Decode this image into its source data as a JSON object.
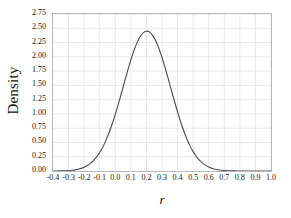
{
  "chart_data": {
    "type": "line",
    "title": "",
    "subtitle": "",
    "xlabel": "r",
    "ylabel": "Density",
    "xlim": [
      -0.4,
      1.0
    ],
    "ylim": [
      0.0,
      2.75
    ],
    "grid": true,
    "legend": null,
    "legend_position": "none",
    "annotations": [],
    "xticks": [
      "-0.4",
      "-0.3",
      "-0.2",
      "-0.1",
      "0.0",
      "0.1",
      "0.2",
      "0.3",
      "0.4",
      "0.5",
      "0.6",
      "0.7",
      "0.8",
      "0.9",
      "1.0"
    ],
    "xtick_values": [
      -0.4,
      -0.3,
      -0.2,
      -0.1,
      0.0,
      0.1,
      0.2,
      0.3,
      0.4,
      0.5,
      0.6,
      0.7,
      0.8,
      0.9,
      1.0
    ],
    "yticks": [
      "0.00",
      "0.25",
      "0.50",
      "0.75",
      "1.00",
      "1.25",
      "1.50",
      "1.75",
      "2.00",
      "2.25",
      "2.50",
      "2.75"
    ],
    "ytick_values": [
      0.0,
      0.25,
      0.5,
      0.75,
      1.0,
      1.25,
      1.5,
      1.75,
      2.0,
      2.25,
      2.5,
      2.75
    ],
    "peak_x": 0.32,
    "peak_y": 2.4,
    "series": [
      {
        "name": "density",
        "color": "#4a4a4a",
        "line_width": 1.1,
        "x": [
          -0.4,
          -0.38,
          -0.36,
          -0.34,
          -0.32,
          -0.3,
          -0.28,
          -0.26,
          -0.24,
          -0.22,
          -0.2,
          -0.18,
          -0.16,
          -0.14,
          -0.12,
          -0.1,
          -0.08,
          -0.06,
          -0.04,
          -0.02,
          0.0,
          0.02,
          0.04,
          0.06,
          0.08,
          0.1,
          0.12,
          0.14,
          0.16,
          0.18,
          0.2,
          0.22,
          0.24,
          0.26,
          0.28,
          0.3,
          0.32,
          0.34,
          0.36,
          0.38,
          0.4,
          0.42,
          0.44,
          0.46,
          0.48,
          0.5,
          0.52,
          0.54,
          0.56,
          0.58,
          0.6,
          0.62,
          0.64,
          0.66,
          0.68,
          0.7,
          0.72,
          0.74,
          0.76,
          0.78,
          0.8,
          0.82,
          0.84,
          0.86,
          0.88,
          0.9,
          0.92,
          0.94,
          0.96,
          0.98,
          1.0
        ],
        "values": [
          0.0,
          0.001,
          0.002,
          0.003,
          0.005,
          0.008,
          0.013,
          0.02,
          0.031,
          0.046,
          0.067,
          0.096,
          0.134,
          0.183,
          0.246,
          0.325,
          0.421,
          0.536,
          0.67,
          0.823,
          0.993,
          1.177,
          1.371,
          1.568,
          1.762,
          1.945,
          2.11,
          2.249,
          2.355,
          2.423,
          2.449,
          2.433,
          2.375,
          2.278,
          2.147,
          1.988,
          1.808,
          1.616,
          1.418,
          1.222,
          1.034,
          0.859,
          0.7,
          0.56,
          0.44,
          0.339,
          0.256,
          0.19,
          0.138,
          0.098,
          0.069,
          0.047,
          0.032,
          0.021,
          0.014,
          0.009,
          0.005,
          0.003,
          0.002,
          0.001,
          0.001,
          0.0,
          0.0,
          0.0,
          0.0,
          0.0,
          0.0,
          0.0,
          0.0,
          0.0,
          0.0
        ]
      }
    ],
    "distribution": {
      "mean": 0.32,
      "sd": 0.166
    },
    "style": {
      "grid_color": "#e8e8e8",
      "axis_color": "#b8b8b8",
      "curve_color": "#4a4a4a",
      "background": "#ffffff",
      "text_color": "#151515"
    }
  }
}
